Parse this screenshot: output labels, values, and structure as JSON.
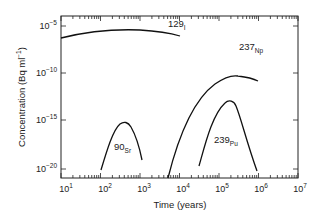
{
  "chart_data": {
    "type": "line",
    "title": "",
    "xlabel": "Time (years)",
    "ylabel": "Concentration (Bq ml⁻¹)",
    "xscale": "log",
    "yscale": "log",
    "xlim": [
      10,
      10000000
    ],
    "ylim": [
      1e-21,
      0.0001
    ],
    "x_ticks": [
      "10^1",
      "10^2",
      "10^3",
      "10^4",
      "10^5",
      "10^6",
      "10^7"
    ],
    "y_ticks": [
      "10^-5",
      "10^-10",
      "10^-15",
      "10^-20"
    ],
    "grid": false,
    "legend": "inline labels",
    "series": [
      {
        "name": "129I",
        "label_main": "129",
        "label_sub": "I",
        "points": [
          [
            10,
            3e-06
          ],
          [
            30,
            6e-06
          ],
          [
            100,
            8e-06
          ],
          [
            300,
            9e-06
          ],
          [
            1000,
            8e-06
          ],
          [
            3000,
            6e-06
          ],
          [
            6000,
            4e-06
          ]
        ]
      },
      {
        "name": "237Np",
        "label_main": "237",
        "label_sub": "Np",
        "points": [
          [
            4000,
            1e-20
          ],
          [
            8000,
            1e-16
          ],
          [
            20000,
            3e-13
          ],
          [
            50000,
            3e-11
          ],
          [
            150000,
            1e-10
          ],
          [
            400000,
            6e-11
          ],
          [
            1000000,
            2e-11
          ]
        ]
      },
      {
        "name": "90Sr",
        "label_main": "90",
        "label_sub": "Sr",
        "points": [
          [
            110,
            2e-20
          ],
          [
            200,
            1e-17
          ],
          [
            400,
            8e-16
          ],
          [
            700,
            1e-16
          ],
          [
            1000,
            1e-18
          ]
        ]
      },
      {
        "name": "239Pu",
        "label_main": "239",
        "label_sub": "Pu",
        "points": [
          [
            30000,
            1e-19
          ],
          [
            60000,
            1e-16
          ],
          [
            150000,
            3e-15
          ],
          [
            300000,
            1e-15
          ],
          [
            600000,
            1e-17
          ],
          [
            1000000,
            1e-20
          ]
        ]
      }
    ]
  },
  "axes": {
    "x_label": "Time (years)",
    "y_label": "Concentration (Bq ml",
    "y_label_sup": "−1",
    "y_label_close": ")",
    "x_ticks": [
      {
        "base": "10",
        "exp": "1"
      },
      {
        "base": "10",
        "exp": "2"
      },
      {
        "base": "10",
        "exp": "3"
      },
      {
        "base": "10",
        "exp": "4"
      },
      {
        "base": "10",
        "exp": "5"
      },
      {
        "base": "10",
        "exp": "6"
      },
      {
        "base": "10",
        "exp": "7"
      }
    ],
    "y_ticks": [
      {
        "base": "10",
        "exp": "−5"
      },
      {
        "base": "10",
        "exp": "−10"
      },
      {
        "base": "10",
        "exp": "−15"
      },
      {
        "base": "10",
        "exp": "−20"
      }
    ]
  },
  "labels": {
    "i129": {
      "main": "129",
      "sub": "I"
    },
    "np237": {
      "main": "237",
      "sub": "Np"
    },
    "sr90": {
      "main": "90",
      "sub": "Sr"
    },
    "pu239": {
      "main": "239",
      "sub": "Pu"
    }
  }
}
